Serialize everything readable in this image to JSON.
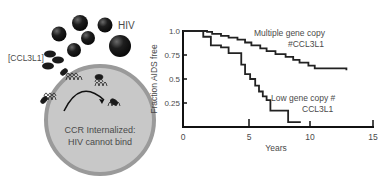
{
  "illustration": {
    "virus_label": "HIV",
    "chemokine_label": "[CCL3L1]",
    "cell_caption_line1": "CCR Internalized:",
    "cell_caption_line2": "HIV cannot bind",
    "colors": {
      "virus": "#1a1a1a",
      "cell_fill": "#c8c8c8",
      "cell_border": "#9a9a9a",
      "text": "#4a4a4a"
    }
  },
  "chart_data": {
    "type": "line",
    "subtype": "kaplan-meier step",
    "title": "",
    "xlabel": "Years",
    "ylabel": "Fraction AIDS free",
    "xlim": [
      0,
      15
    ],
    "ylim": [
      0,
      1.0
    ],
    "xticks": [
      "0",
      "5",
      "10",
      "15"
    ],
    "yticks": [
      "1.0",
      "0.75",
      "0.5",
      "0.25"
    ],
    "grid": false,
    "legend": "inline annotations",
    "series": [
      {
        "name": "Multiple gene copy #CCL3L1",
        "label_line1": "Multiple gene copy",
        "label_line2": "#CCL3L1",
        "x": [
          0,
          1.9,
          2.3,
          3.0,
          3.6,
          4.3,
          4.9,
          5.4,
          6.1,
          6.6,
          7.3,
          8.1,
          8.7,
          9.2,
          9.9,
          10.4,
          12.9
        ],
        "y": [
          1.0,
          0.99,
          0.97,
          0.95,
          0.93,
          0.91,
          0.88,
          0.85,
          0.82,
          0.79,
          0.76,
          0.73,
          0.7,
          0.67,
          0.64,
          0.61,
          0.59
        ]
      },
      {
        "name": "Low gene copy # CCL3L1",
        "label_line1": "Low gene copy #",
        "label_line2": "CCL3L1",
        "x": [
          0,
          1.6,
          2.2,
          3.0,
          3.6,
          4.4,
          4.6,
          4.9,
          5.3,
          5.7,
          6.0,
          6.3,
          6.6,
          6.9,
          8.3,
          9.3
        ],
        "y": [
          1.0,
          0.94,
          0.85,
          0.83,
          0.77,
          0.77,
          0.65,
          0.55,
          0.5,
          0.43,
          0.37,
          0.32,
          0.28,
          0.17,
          0.05,
          0.05
        ]
      }
    ]
  }
}
